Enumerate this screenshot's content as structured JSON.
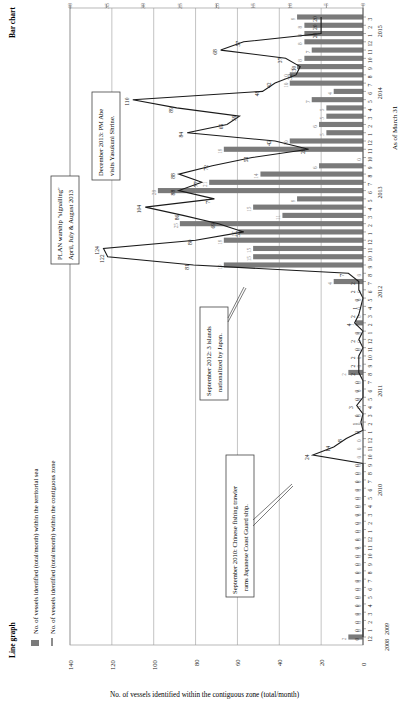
{
  "chart_data": {
    "type": "bar+line (combo, rotated 90°)",
    "title_line": "Line graph",
    "title_bar": "Bar chart",
    "as_of": "As of March 31",
    "xlabel": "Month / Year",
    "ylabel_line": "No. of vessels identified within the contiguous zone (total/month)",
    "ylabel_bar": "No. of vessels identified within the territorial sea (total/month)",
    "line_axis": {
      "min": 0,
      "max": 140,
      "ticks": [
        0,
        20,
        40,
        60,
        80,
        100,
        120,
        140
      ]
    },
    "bar_axis": {
      "min": 0,
      "max": 40,
      "ticks": [
        0,
        5,
        10,
        15,
        20,
        25,
        30,
        35,
        40
      ]
    },
    "grid": true,
    "legend": {
      "position": "top-left",
      "entries": [
        {
          "type": "bar",
          "label": "No. of vessels identified (total/month) within the territorial sea"
        },
        {
          "type": "line",
          "label": "No. of vessels identified (total/month) within the contiguous zone"
        }
      ]
    },
    "years": [
      {
        "label": "2008",
        "start_index": 0
      },
      {
        "label": "2009",
        "start_index": 1
      },
      {
        "label": "2010",
        "start_index": 13
      },
      {
        "label": "2011",
        "start_index": 25
      },
      {
        "label": "2012",
        "start_index": 37
      },
      {
        "label": "2013",
        "start_index": 49
      },
      {
        "label": "2014",
        "start_index": 61
      },
      {
        "label": "2015",
        "start_index": 73
      }
    ],
    "categories": [
      "12",
      "1",
      "2",
      "3",
      "4",
      "5",
      "6",
      "7",
      "8",
      "9",
      "10",
      "11",
      "12",
      "1",
      "2",
      "3",
      "4",
      "5",
      "6",
      "7",
      "8",
      "9",
      "10",
      "11",
      "12",
      "1",
      "2",
      "3",
      "4",
      "5",
      "6",
      "7",
      "8",
      "9",
      "10",
      "11",
      "12",
      "1",
      "2",
      "3",
      "4",
      "5",
      "6",
      "7",
      "8",
      "9",
      "10",
      "11",
      "12",
      "1",
      "2",
      "3",
      "4",
      "5",
      "6",
      "7",
      "8",
      "9",
      "10",
      "11",
      "12",
      "1",
      "2",
      "3",
      "4",
      "5",
      "6",
      "7",
      "8",
      "9",
      "10",
      "11",
      "12",
      "1",
      "2",
      "3"
    ],
    "series": [
      {
        "name": "Territorial sea (bar)",
        "values": [
          2,
          0,
          0,
          0,
          0,
          0,
          0,
          0,
          0,
          0,
          0,
          0,
          0,
          0,
          0,
          0,
          0,
          0,
          0,
          0,
          0,
          0,
          0,
          0,
          0,
          0,
          0,
          0,
          0,
          0,
          0,
          0,
          2,
          0,
          0,
          0,
          0,
          0,
          1,
          0,
          0,
          0,
          0,
          4,
          0,
          19,
          15,
          15,
          19,
          17,
          25,
          11,
          15,
          9,
          28,
          21,
          14,
          6,
          0,
          19,
          10,
          5,
          6,
          5,
          5,
          7,
          4,
          10,
          10,
          9,
          8,
          7,
          8,
          8,
          8,
          9
        ]
      },
      {
        "name": "Contiguous zone (line)",
        "values": [
          0,
          0,
          0,
          0,
          0,
          0,
          0,
          0,
          0,
          0,
          0,
          0,
          0,
          0,
          0,
          0,
          0,
          0,
          0,
          0,
          0,
          0,
          24,
          14,
          8,
          0,
          1,
          0,
          3,
          0,
          0,
          0,
          2,
          2,
          2,
          0,
          2,
          0,
          4,
          2,
          1,
          0,
          2,
          2,
          7,
          81,
          122,
          124,
          80,
          57,
          69,
          86,
          104,
          71,
          88,
          77,
          88,
          72,
          53,
          26,
          42,
          84,
          65,
          59,
          89,
          110,
          48,
          42,
          32,
          30,
          37,
          68,
          57,
          20,
          20,
          20
        ]
      }
    ],
    "annotations": [
      {
        "text": "September 2010: Chinese fishing trawler rams Japanese Coast Guard ship.",
        "value": 24
      },
      {
        "text": "September 2012: 3 islands nationalized by Japan.",
        "value": 81
      },
      {
        "text": "PLAN warship \"signalling\" April, July & August 2013",
        "value": 104
      },
      {
        "text": "December 2013: PM Abe visits Yasukuni Shrine.",
        "value": 110
      }
    ]
  },
  "labels": {
    "title_line": "Line graph",
    "title_bar": "Bar chart",
    "as_of": "As of March 31",
    "ylabel_line": "No. of vessels identified within the contiguous zone (total/month)",
    "legend_bar": "No. of vessels identified (total/month) within the territorial sea",
    "legend_line": "No. of vessels identified (total/month) within the contiguous zone",
    "ann_2010_l1": "September 2010: Chinese fishing trawler",
    "ann_2010_l2": "rams Japanese Coast Guard ship.",
    "ann_2012_l1": "September 2012: 3 islands",
    "ann_2012_l2": "nationalized by Japan.",
    "ann_2013a_l1": "PLAN warship \"signalling\"",
    "ann_2013a_l2": "April, July & August 2013",
    "ann_2013b_l1": "December 2013: PM Abe",
    "ann_2013b_l2": "visits Yasukuni Shrine."
  },
  "colors": {
    "bar": "#7a7a7a",
    "line": "#1a1a1a",
    "grid": "#9a9a9a",
    "axis": "#555555",
    "text": "#222222",
    "muted_text": "#8a8a8a"
  }
}
